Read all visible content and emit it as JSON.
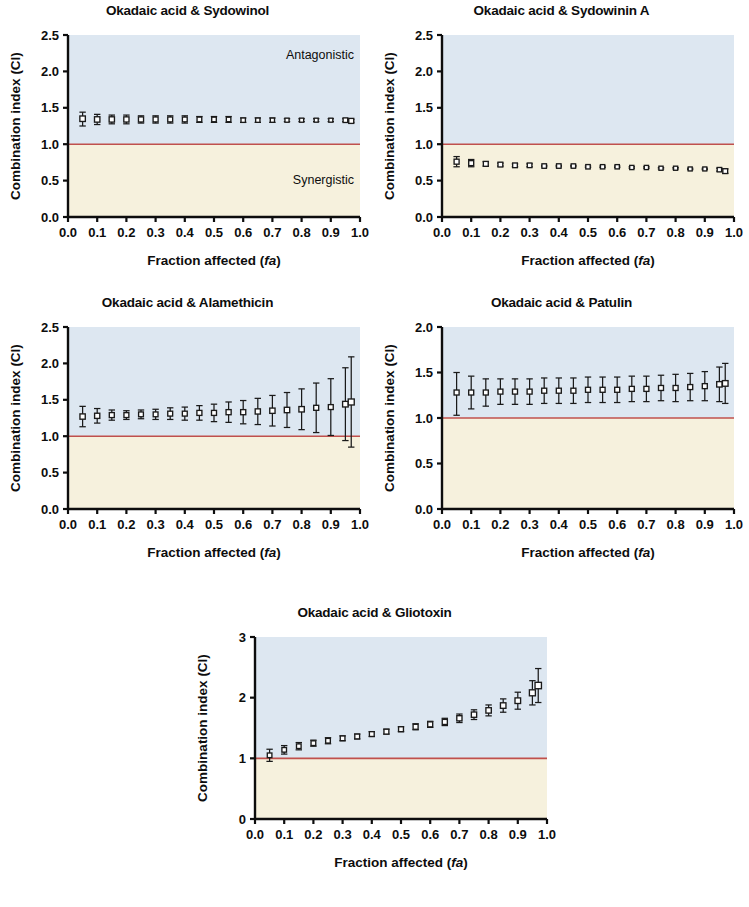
{
  "figure": {
    "background": "#ffffff",
    "axis_color": "#0d0d0d",
    "marker_color": "#1a1a1a",
    "reference_line_color": "#c0504d",
    "antagonistic_fill": "#dde7f1",
    "synergistic_fill": "#f6f1dd",
    "panel_count": 5
  },
  "common": {
    "xlabel_main": "Fraction affected (",
    "xlabel_italic": "fa",
    "xlabel_close": ")",
    "ylabel": "Combination index (CI)",
    "x_tick_labels": [
      "0.0",
      "0.1",
      "0.2",
      "0.3",
      "0.4",
      "0.5",
      "0.6",
      "0.7",
      "0.8",
      "0.9",
      "1.0"
    ],
    "x_ticks": [
      0.0,
      0.1,
      0.2,
      0.3,
      0.4,
      0.5,
      0.6,
      0.7,
      0.8,
      0.9,
      1.0
    ],
    "xlim": [
      0.0,
      1.0
    ],
    "reference_line_value": 1.0,
    "zone_label_antagonistic": "Antagonistic",
    "zone_label_synergistic": "Synergistic"
  },
  "chart_data": [
    {
      "id": "sydowinol",
      "type": "scatter",
      "title": "Okadaic acid & Sydowinol",
      "xlabel": "Fraction affected (fa)",
      "ylabel": "Combination index (CI)",
      "xlim": [
        0.0,
        1.0
      ],
      "ylim": [
        0.0,
        2.5
      ],
      "y_ticks": [
        0.0,
        0.5,
        1.0,
        1.5,
        2.0,
        2.5
      ],
      "y_tick_labels": [
        "0.0",
        "0.5",
        "1.0",
        "1.5",
        "2.0",
        "2.5"
      ],
      "reference_line": 1.0,
      "show_zone_labels": true,
      "grid": false,
      "legend": "none",
      "x": [
        0.05,
        0.1,
        0.15,
        0.2,
        0.25,
        0.3,
        0.35,
        0.4,
        0.45,
        0.5,
        0.55,
        0.6,
        0.65,
        0.7,
        0.75,
        0.8,
        0.85,
        0.9,
        0.95,
        0.97
      ],
      "values": [
        1.35,
        1.34,
        1.34,
        1.34,
        1.34,
        1.34,
        1.34,
        1.34,
        1.34,
        1.34,
        1.34,
        1.33,
        1.33,
        1.33,
        1.33,
        1.33,
        1.33,
        1.33,
        1.33,
        1.32
      ],
      "err_low": [
        0.1,
        0.07,
        0.06,
        0.06,
        0.05,
        0.05,
        0.05,
        0.05,
        0.04,
        0.04,
        0.04,
        0.03,
        0.03,
        0.03,
        0.02,
        0.02,
        0.02,
        0.02,
        0.02,
        0.02
      ],
      "err_high": [
        0.09,
        0.07,
        0.06,
        0.06,
        0.05,
        0.05,
        0.05,
        0.05,
        0.04,
        0.04,
        0.04,
        0.03,
        0.03,
        0.03,
        0.02,
        0.02,
        0.02,
        0.02,
        0.02,
        0.02
      ],
      "marker_sizes": [
        5.5,
        5.4,
        5.3,
        5.2,
        5.1,
        5.0,
        4.9,
        4.8,
        4.7,
        4.6,
        4.5,
        4.4,
        4.3,
        4.2,
        4.1,
        4.1,
        4.0,
        4.0,
        4.6,
        5.0
      ]
    },
    {
      "id": "sydowinin-a",
      "type": "scatter",
      "title": "Okadaic acid & Sydowinin A",
      "xlabel": "Fraction affected (fa)",
      "ylabel": "Combination index (CI)",
      "xlim": [
        0.0,
        1.0
      ],
      "ylim": [
        0.0,
        2.5
      ],
      "y_ticks": [
        0.0,
        0.5,
        1.0,
        1.5,
        2.0,
        2.5
      ],
      "y_tick_labels": [
        "0.0",
        "0.5",
        "1.0",
        "1.5",
        "2.0",
        "2.5"
      ],
      "reference_line": 1.0,
      "show_zone_labels": false,
      "grid": false,
      "legend": "none",
      "x": [
        0.05,
        0.1,
        0.15,
        0.2,
        0.25,
        0.3,
        0.35,
        0.4,
        0.45,
        0.5,
        0.55,
        0.6,
        0.65,
        0.7,
        0.75,
        0.8,
        0.85,
        0.9,
        0.95,
        0.97
      ],
      "values": [
        0.76,
        0.74,
        0.73,
        0.72,
        0.71,
        0.71,
        0.7,
        0.7,
        0.7,
        0.69,
        0.69,
        0.69,
        0.68,
        0.68,
        0.67,
        0.67,
        0.66,
        0.66,
        0.65,
        0.63
      ],
      "err_low": [
        0.07,
        0.05,
        0.03,
        0.02,
        0.02,
        0.02,
        0.01,
        0.01,
        0.01,
        0.01,
        0.01,
        0.01,
        0.01,
        0.01,
        0.01,
        0.01,
        0.01,
        0.01,
        0.02,
        0.03
      ],
      "err_high": [
        0.07,
        0.05,
        0.03,
        0.02,
        0.02,
        0.02,
        0.01,
        0.01,
        0.01,
        0.01,
        0.01,
        0.01,
        0.01,
        0.01,
        0.01,
        0.01,
        0.01,
        0.01,
        0.02,
        0.03
      ],
      "marker_sizes": [
        5.0,
        5.0,
        4.9,
        4.8,
        4.7,
        4.6,
        4.5,
        4.5,
        4.4,
        4.4,
        4.3,
        4.3,
        4.2,
        4.2,
        4.1,
        4.1,
        4.0,
        4.0,
        4.4,
        4.8
      ]
    },
    {
      "id": "alamethicin",
      "type": "scatter",
      "title": "Okadaic acid & Alamethicin",
      "xlabel": "Fraction affected (fa)",
      "ylabel": "Combination index (CI)",
      "xlim": [
        0.0,
        1.0
      ],
      "ylim": [
        0.0,
        2.5
      ],
      "y_ticks": [
        0.0,
        0.5,
        1.0,
        1.5,
        2.0,
        2.5
      ],
      "y_tick_labels": [
        "0.0",
        "0.5",
        "1.0",
        "1.5",
        "2.0",
        "2.5"
      ],
      "reference_line": 1.0,
      "show_zone_labels": false,
      "grid": false,
      "legend": "none",
      "x": [
        0.05,
        0.1,
        0.15,
        0.2,
        0.25,
        0.3,
        0.35,
        0.4,
        0.45,
        0.5,
        0.55,
        0.6,
        0.65,
        0.7,
        0.75,
        0.8,
        0.85,
        0.9,
        0.95,
        0.97
      ],
      "values": [
        1.27,
        1.28,
        1.29,
        1.29,
        1.3,
        1.3,
        1.31,
        1.31,
        1.32,
        1.32,
        1.33,
        1.33,
        1.34,
        1.35,
        1.36,
        1.37,
        1.39,
        1.4,
        1.44,
        1.47
      ],
      "err_low": [
        0.14,
        0.1,
        0.07,
        0.06,
        0.06,
        0.07,
        0.08,
        0.09,
        0.1,
        0.12,
        0.14,
        0.16,
        0.18,
        0.21,
        0.24,
        0.28,
        0.34,
        0.39,
        0.5,
        0.62
      ],
      "err_high": [
        0.14,
        0.1,
        0.07,
        0.06,
        0.06,
        0.07,
        0.08,
        0.09,
        0.1,
        0.12,
        0.14,
        0.16,
        0.18,
        0.21,
        0.24,
        0.28,
        0.34,
        0.39,
        0.5,
        0.62
      ],
      "marker_sizes": [
        5.3,
        5.2,
        5.0,
        4.9,
        4.8,
        4.8,
        4.9,
        4.9,
        5.0,
        5.0,
        5.1,
        5.1,
        5.2,
        5.3,
        5.4,
        5.4,
        5.0,
        4.9,
        5.6,
        6.0
      ]
    },
    {
      "id": "patulin",
      "type": "scatter",
      "title": "Okadaic acid & Patulin",
      "xlabel": "Fraction affected (fa)",
      "ylabel": "Combination index (CI)",
      "xlim": [
        0.0,
        1.0
      ],
      "ylim": [
        0.0,
        2.0
      ],
      "y_ticks": [
        0.0,
        0.5,
        1.0,
        1.5,
        2.0
      ],
      "y_tick_labels": [
        "0.0",
        "0.5",
        "1.0",
        "1.5",
        "2.0"
      ],
      "reference_line": 1.0,
      "show_zone_labels": false,
      "grid": false,
      "legend": "none",
      "x": [
        0.05,
        0.1,
        0.15,
        0.2,
        0.25,
        0.3,
        0.35,
        0.4,
        0.45,
        0.5,
        0.55,
        0.6,
        0.65,
        0.7,
        0.75,
        0.8,
        0.85,
        0.9,
        0.95,
        0.97
      ],
      "values": [
        1.28,
        1.28,
        1.28,
        1.29,
        1.29,
        1.29,
        1.3,
        1.3,
        1.3,
        1.31,
        1.31,
        1.31,
        1.32,
        1.32,
        1.33,
        1.33,
        1.34,
        1.35,
        1.37,
        1.38
      ],
      "err_low": [
        0.25,
        0.18,
        0.15,
        0.14,
        0.14,
        0.14,
        0.14,
        0.14,
        0.14,
        0.14,
        0.14,
        0.14,
        0.14,
        0.14,
        0.14,
        0.15,
        0.15,
        0.16,
        0.19,
        0.22
      ],
      "err_high": [
        0.22,
        0.18,
        0.15,
        0.14,
        0.14,
        0.14,
        0.14,
        0.14,
        0.14,
        0.14,
        0.14,
        0.14,
        0.14,
        0.14,
        0.14,
        0.15,
        0.15,
        0.16,
        0.19,
        0.22
      ],
      "marker_sizes": [
        5.0,
        5.0,
        5.0,
        5.0,
        5.0,
        5.0,
        5.0,
        5.0,
        5.0,
        5.0,
        5.0,
        5.0,
        5.0,
        5.0,
        5.0,
        5.0,
        5.0,
        5.0,
        5.4,
        5.6
      ]
    },
    {
      "id": "gliotoxin",
      "type": "scatter",
      "title": "Okadaic acid & Gliotoxin",
      "xlabel": "Fraction affected (fa)",
      "ylabel": "Combination index (CI)",
      "xlim": [
        0.0,
        1.0
      ],
      "ylim": [
        0.0,
        3.0
      ],
      "y_ticks": [
        0,
        1,
        2,
        3
      ],
      "y_tick_labels": [
        "0",
        "1",
        "2",
        "3"
      ],
      "reference_line": 1.0,
      "show_zone_labels": false,
      "grid": false,
      "legend": "none",
      "x": [
        0.05,
        0.1,
        0.15,
        0.2,
        0.25,
        0.3,
        0.35,
        0.4,
        0.45,
        0.5,
        0.55,
        0.6,
        0.65,
        0.7,
        0.75,
        0.8,
        0.85,
        0.9,
        0.95,
        0.97
      ],
      "values": [
        1.05,
        1.14,
        1.2,
        1.25,
        1.29,
        1.33,
        1.36,
        1.4,
        1.44,
        1.48,
        1.52,
        1.56,
        1.6,
        1.66,
        1.72,
        1.79,
        1.87,
        1.95,
        2.08,
        2.2
      ],
      "err_low": [
        0.1,
        0.07,
        0.06,
        0.05,
        0.05,
        0.04,
        0.04,
        0.04,
        0.04,
        0.04,
        0.05,
        0.05,
        0.06,
        0.07,
        0.08,
        0.09,
        0.11,
        0.14,
        0.2,
        0.28
      ],
      "err_high": [
        0.1,
        0.07,
        0.06,
        0.05,
        0.05,
        0.04,
        0.04,
        0.04,
        0.04,
        0.04,
        0.05,
        0.05,
        0.06,
        0.07,
        0.08,
        0.09,
        0.11,
        0.14,
        0.2,
        0.28
      ],
      "marker_sizes": [
        4.6,
        4.6,
        4.6,
        4.7,
        4.7,
        4.7,
        4.8,
        4.8,
        4.9,
        4.9,
        5.0,
        5.0,
        5.1,
        5.2,
        5.3,
        5.4,
        5.5,
        5.6,
        6.0,
        6.4
      ]
    }
  ]
}
